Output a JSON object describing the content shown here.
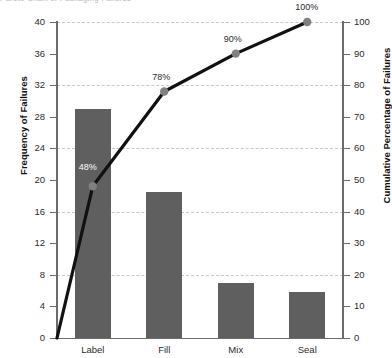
{
  "title_strip": "Pareto Chart of Packaging Failures",
  "chart_data": {
    "type": "bar",
    "title": "",
    "categories": [
      "Label",
      "Fill",
      "Mix",
      "Seal"
    ],
    "series": [
      {
        "name": "Frequency of Failures",
        "type": "bar",
        "values": [
          29,
          18.5,
          7,
          5.8
        ]
      },
      {
        "name": "Cumulative Percentage of Failures",
        "type": "line",
        "values": [
          48,
          78,
          90,
          100
        ],
        "origin": 0
      }
    ],
    "values": [
      29,
      18.5,
      7,
      5.8
    ],
    "cumulative_percent": [
      48,
      78,
      90,
      100
    ],
    "point_labels": [
      "48%",
      "78%",
      "90%",
      "100%"
    ],
    "xlabel": "",
    "ylabel": "Frequency of Failures",
    "y2label": "Cumulative Percentage of Failures",
    "ylim": [
      0,
      40
    ],
    "y2lim": [
      0,
      100
    ],
    "yticks": [
      0,
      4,
      8,
      12,
      16,
      20,
      24,
      28,
      32,
      36,
      40
    ],
    "y2ticks": [
      0,
      10,
      20,
      30,
      40,
      50,
      60,
      70,
      80,
      90,
      100
    ],
    "grid": true,
    "legend": "none",
    "colors": {
      "bar": "#5f5f5f",
      "line": "#111111",
      "marker": "#808080",
      "grid": "#c7c7c7",
      "axis": "#6b6b6b",
      "text": "#2b2b2b",
      "bar_label_text": "#ffffff"
    }
  },
  "axes": {
    "left": {
      "title": "Frequency of Failures",
      "tick_labels": [
        "0",
        "4",
        "8",
        "12",
        "16",
        "20",
        "24",
        "28",
        "32",
        "36",
        "40"
      ]
    },
    "right": {
      "title": "Cumulative Percentage of Failures",
      "tick_labels": [
        "0",
        "10",
        "20",
        "30",
        "40",
        "50",
        "60",
        "70",
        "80",
        "90",
        "100"
      ]
    },
    "bottom": {
      "tick_labels": [
        "Label",
        "Fill",
        "Mix",
        "Seal"
      ]
    }
  }
}
